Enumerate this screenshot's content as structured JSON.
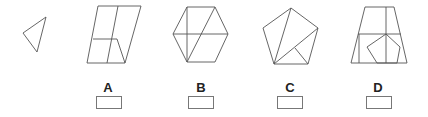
{
  "question": {
    "target_shape": "triangle",
    "options": [
      {
        "label": "A",
        "figure": "parallelogram-with-lines",
        "answer": ""
      },
      {
        "label": "B",
        "figure": "hexagon-with-lines",
        "answer": ""
      },
      {
        "label": "C",
        "figure": "pentagon-with-lines",
        "answer": ""
      },
      {
        "label": "D",
        "figure": "trapezoid-with-inner-pentagon",
        "answer": ""
      }
    ]
  },
  "colors": {
    "stroke": "#555555",
    "label": "#222222",
    "box_border": "#777777"
  }
}
